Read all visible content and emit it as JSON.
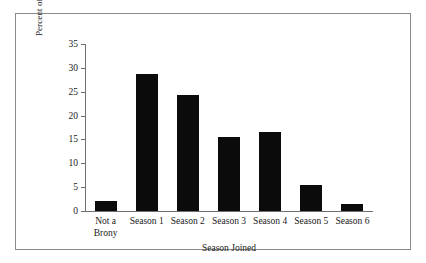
{
  "chart_data": {
    "type": "bar",
    "title": "",
    "xlabel": "Season Joined",
    "ylabel": "Percent of Fandom",
    "categories": [
      "Not a\nBrony",
      "Season 1",
      "Season 2",
      "Season 3",
      "Season 4",
      "Season 5",
      "Season 6"
    ],
    "values": [
      2.1,
      28.7,
      24.4,
      15.6,
      16.6,
      5.4,
      1.4
    ],
    "ylim": [
      0,
      35
    ],
    "yticks": [
      0,
      5,
      10,
      15,
      20,
      25,
      30,
      35
    ],
    "ytick_labels": [
      "0",
      "5",
      "10",
      "15",
      "20",
      "25",
      "30",
      "35"
    ],
    "grid": false,
    "legend": false,
    "legend_position": "none",
    "bar_color": "#0b0b0b",
    "axis_color": "#6f6f6f",
    "frame_color": "#8a8a8a",
    "background_color": "#ffffff"
  }
}
